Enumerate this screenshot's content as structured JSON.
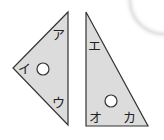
{
  "figure": {
    "left_triangle": {
      "fill": "#dcdcdc",
      "stroke": "#333333",
      "labels": {
        "top": "ア",
        "left": "イ",
        "bottom": "ウ"
      }
    },
    "right_triangle": {
      "fill": "#dcdcdc",
      "stroke": "#333333",
      "labels": {
        "top": "エ",
        "bottom_left": "オ",
        "bottom_right": "カ"
      }
    },
    "hole_color": "#ffffff"
  }
}
